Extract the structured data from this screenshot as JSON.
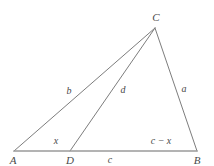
{
  "figure": {
    "type": "geometry-diagram",
    "shape": "triangle-with-cevian",
    "background_color": "#ffffff",
    "stroke_color": "#7d7d7d",
    "baseline_color": "#9a9a9a",
    "label_color": "#4a4a4a"
  },
  "vertices": [
    {
      "id": "A",
      "label": "A",
      "x": 14,
      "y": 151,
      "label_x": 13,
      "label_y": 160
    },
    {
      "id": "D",
      "label": "D",
      "x": 70,
      "y": 151,
      "label_x": 70,
      "label_y": 160
    },
    {
      "id": "B",
      "label": "B",
      "x": 197,
      "y": 151,
      "label_x": 197,
      "label_y": 160
    },
    {
      "id": "C",
      "label": "C",
      "x": 155,
      "y": 28,
      "label_x": 156,
      "label_y": 17
    }
  ],
  "edges": [
    {
      "id": "AC",
      "from": "A",
      "to": "C",
      "label": "b",
      "label_x": 69,
      "label_y": 91
    },
    {
      "id": "DC",
      "from": "D",
      "to": "C",
      "label": "d",
      "label_x": 123,
      "label_y": 90
    },
    {
      "id": "BC",
      "from": "B",
      "to": "C",
      "label": "a",
      "label_x": 184,
      "label_y": 89
    },
    {
      "id": "AD",
      "from": "A",
      "to": "D",
      "label": "x",
      "label_x": 56,
      "label_y": 141
    },
    {
      "id": "DB",
      "from": "D",
      "to": "B",
      "label": "c − x",
      "label_x": 161,
      "label_y": 141
    },
    {
      "id": "AB",
      "from": "A",
      "to": "B",
      "label": "c",
      "label_x": 110,
      "label_y": 160
    }
  ],
  "labels": {
    "vertex_a": "A",
    "vertex_b": "B",
    "vertex_c": "C",
    "vertex_d": "D",
    "side_a": "a",
    "side_b": "b",
    "side_c": "c",
    "cevian_d": "d",
    "segment_x": "x",
    "segment_c_minus_x": "c − x"
  }
}
